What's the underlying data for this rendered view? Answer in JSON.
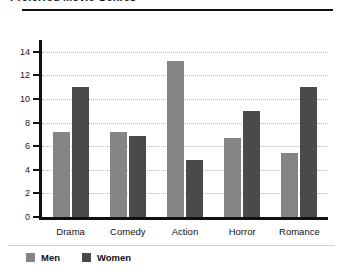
{
  "chart_data": {
    "type": "bar",
    "title": "Preferred Movie Genres",
    "xlabel": "",
    "ylabel": "",
    "categories": [
      "Drama",
      "Comedy",
      "Action",
      "Horror",
      "Romance"
    ],
    "series": [
      {
        "name": "Men",
        "color": "#858585",
        "values": [
          7.2,
          7.2,
          13.2,
          6.7,
          5.4
        ]
      },
      {
        "name": "Women",
        "color": "#4a4a4a",
        "values": [
          11.0,
          6.9,
          4.8,
          9.0,
          11.0
        ]
      }
    ],
    "ylim": [
      0,
      15
    ],
    "yticks": [
      0,
      2,
      4,
      6,
      8,
      10,
      12,
      14
    ],
    "ytick_labels": [
      "0",
      "2",
      "4",
      "6",
      "8",
      "10",
      "12",
      "14"
    ],
    "grid": true,
    "grid_style": "dotted",
    "legend_position": "bottom-left"
  }
}
